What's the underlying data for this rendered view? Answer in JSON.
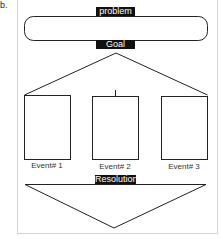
{
  "item_marker": "b.",
  "diagram": {
    "problem_label": "problem",
    "goal_label": "Goal",
    "resolution_label": "Resolution",
    "events": [
      {
        "label": "Event# 1"
      },
      {
        "label": "Event# 2"
      },
      {
        "label": "Event# 3"
      }
    ],
    "colors": {
      "stroke": "#222222",
      "label_bg": "#111111",
      "label_text": "#ffffff",
      "frame": "#d4d4d4"
    }
  }
}
